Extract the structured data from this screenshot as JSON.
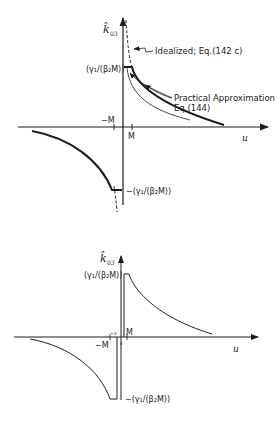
{
  "colors": {
    "ink": "#1e1e1e",
    "background": "#ffffff"
  },
  "top_plot": {
    "y_axis_label": "k̂",
    "y_axis_subscript": "03",
    "x_axis_label": "u",
    "x_tick_pos": "M",
    "x_tick_neg": "−M",
    "y_level_pos_label": "(γ₁/(β₂M))",
    "y_level_neg_label": "−(γ₁/(β₂M))",
    "idealized_label": "Idealized; Eq.(142 c)",
    "approx_label_line1": "Practical Approximation",
    "approx_label_line2": "Eq.(144)"
  },
  "bottom_plot": {
    "y_axis_label": "k̂",
    "y_axis_subscript": "03",
    "x_axis_label": "u",
    "x_tick_pos": "M",
    "x_tick_neg": "−M",
    "x_tick_eps_pos": "ε",
    "x_tick_eps_neg": "−ε",
    "y_level_pos_label": "(γ₁/(β₂M))",
    "y_level_neg_label": "−(γ₁/(β₂M))"
  }
}
